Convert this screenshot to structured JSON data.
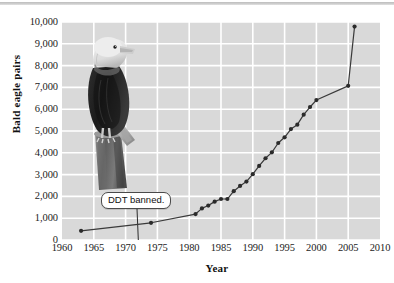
{
  "figure": {
    "title_bar": "",
    "annotation": {
      "text": "DDT banned.",
      "year": 1972
    },
    "photo": {
      "alt": "bald-eagle-perched-on-stump",
      "style": "grayscale photograph"
    }
  },
  "colors": {
    "plot_background": "#d9d9d9",
    "gridline": "#ffffff",
    "series_line": "#3a3a3a",
    "marker": "#2b2b2b",
    "text": "#1c1c1c",
    "top_rule": "#c4c4c4"
  },
  "chart_data": {
    "type": "line",
    "title": "",
    "subtitle": "",
    "xlabel": "Year",
    "ylabel": "Bald eagle pairs",
    "xlim": [
      1960,
      2010
    ],
    "ylim": [
      0,
      10000
    ],
    "xticks": [
      1960,
      1965,
      1970,
      1975,
      1980,
      1985,
      1990,
      1995,
      2000,
      2005,
      2010
    ],
    "xticklabels": [
      "1960",
      "1965",
      "1970",
      "1975",
      "1980",
      "1985",
      "1990",
      "1995",
      "2000",
      "2005",
      "2010"
    ],
    "yticks": [
      0,
      1000,
      2000,
      3000,
      4000,
      5000,
      6000,
      7000,
      8000,
      9000,
      10000
    ],
    "yticklabels": [
      "0",
      "1,000",
      "2,000",
      "3,000",
      "4,000",
      "5,000",
      "6,000",
      "7,000",
      "8,000",
      "9,000",
      "10,000"
    ],
    "grid": true,
    "legend": false,
    "legend_position": "none",
    "markers": true,
    "series": [
      {
        "name": "Bald eagle pairs",
        "x": [
          1963,
          1974,
          1981,
          1982,
          1983,
          1984,
          1985,
          1986,
          1987,
          1988,
          1989,
          1990,
          1991,
          1992,
          1993,
          1994,
          1995,
          1996,
          1997,
          1998,
          1999,
          2000,
          2005,
          2006
        ],
        "values": [
          420,
          790,
          1190,
          1450,
          1580,
          1760,
          1880,
          1880,
          2240,
          2480,
          2680,
          3020,
          3400,
          3750,
          4020,
          4450,
          4710,
          5090,
          5290,
          5750,
          6100,
          6420,
          7070,
          9790
        ]
      }
    ],
    "annotations": [
      {
        "text": "DDT banned.",
        "x": 1972,
        "y": 2000,
        "leader_to_x": 1972,
        "leader_to_y": 0
      }
    ]
  },
  "axes": {
    "x": {
      "ticks": [
        {
          "label": "1960",
          "value": 1960
        },
        {
          "label": "1965",
          "value": 1965
        },
        {
          "label": "1970",
          "value": 1970
        },
        {
          "label": "1975",
          "value": 1975
        },
        {
          "label": "1980",
          "value": 1980
        },
        {
          "label": "1985",
          "value": 1985
        },
        {
          "label": "1990",
          "value": 1990
        },
        {
          "label": "1995",
          "value": 1995
        },
        {
          "label": "2000",
          "value": 2000
        },
        {
          "label": "2005",
          "value": 2005
        },
        {
          "label": "2010",
          "value": 2010
        }
      ],
      "title": "Year"
    },
    "y": {
      "ticks": [
        {
          "label": "0",
          "value": 0
        },
        {
          "label": "1,000",
          "value": 1000
        },
        {
          "label": "2,000",
          "value": 2000
        },
        {
          "label": "3,000",
          "value": 3000
        },
        {
          "label": "4,000",
          "value": 4000
        },
        {
          "label": "5,000",
          "value": 5000
        },
        {
          "label": "6,000",
          "value": 6000
        },
        {
          "label": "7,000",
          "value": 7000
        },
        {
          "label": "8,000",
          "value": 8000
        },
        {
          "label": "9,000",
          "value": 9000
        },
        {
          "label": "10,000",
          "value": 10000
        }
      ],
      "title": "Bald eagle pairs"
    }
  }
}
